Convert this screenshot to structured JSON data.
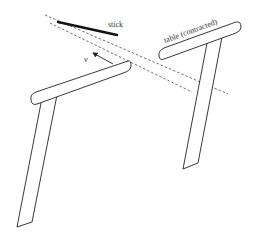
{
  "diagram": {
    "labels": {
      "stick": "stick",
      "table": "table (contracted)",
      "velocity": "v"
    },
    "colors": {
      "stroke": "#222222",
      "background": "#ffffff"
    }
  }
}
